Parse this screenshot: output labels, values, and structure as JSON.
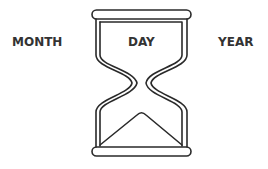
{
  "labels": {
    "month": "MONTH",
    "day": "DAY",
    "year": "YEAR"
  },
  "icon": "hourglass-icon",
  "colors": {
    "text": "#333333",
    "stroke": "#2a2a2a",
    "background": "#ffffff"
  }
}
